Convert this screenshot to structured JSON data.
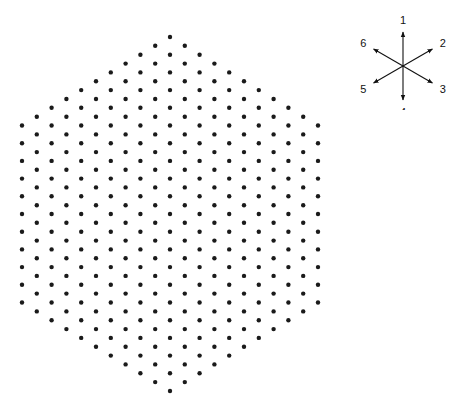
{
  "diagram": {
    "type": "hexagonal-lattice",
    "dot_color": "#1a1a1a",
    "background": "#ffffff",
    "lattice": {
      "center": [
        170,
        214
      ],
      "radius_steps": 10,
      "column_spacing": 14.8,
      "row_spacing": 17.7,
      "dot_radius": 2.2,
      "center_marker": "star-dot"
    },
    "compass": {
      "center": [
        403,
        66
      ],
      "directions": [
        {
          "label": "1",
          "angle_deg": 90
        },
        {
          "label": "2",
          "angle_deg": 30
        },
        {
          "label": "3",
          "angle_deg": -30
        },
        {
          "label": "4",
          "angle_deg": -90
        },
        {
          "label": "5",
          "angle_deg": -150
        },
        {
          "label": "6",
          "angle_deg": 150
        }
      ]
    }
  }
}
